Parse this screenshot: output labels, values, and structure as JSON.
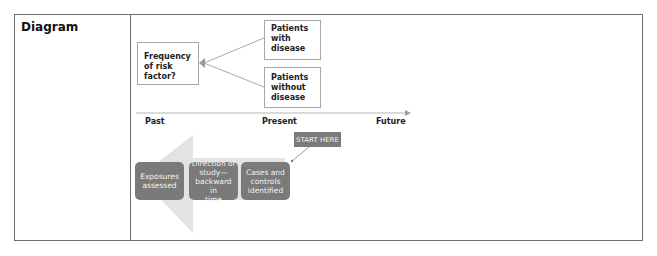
{
  "table": {
    "row_label": "Diagram"
  },
  "diagram": {
    "risk_box": "Frequency of risk factor?",
    "risk_lines": [
      "Frequency",
      "of risk",
      "factor?"
    ],
    "cases_box_lines": [
      "Patients",
      "with",
      "disease"
    ],
    "controls_box_lines": [
      "Patients",
      "without",
      "disease"
    ],
    "timeline": {
      "past": "Past",
      "present": "Present",
      "future": "Future"
    },
    "start_label": "START HERE",
    "steps": [
      {
        "lines": [
          "Exposures",
          "assessed"
        ]
      },
      {
        "lines": [
          "Direction of",
          "study—",
          "backward in",
          "time"
        ]
      },
      {
        "lines": [
          "Cases and",
          "controls",
          "identified"
        ]
      }
    ],
    "colors": {
      "step_fill": "#7a7a7a",
      "arrow_fill": "#e3e3e3",
      "line": "#a8a8a8",
      "border": "#6f6f6f"
    }
  }
}
